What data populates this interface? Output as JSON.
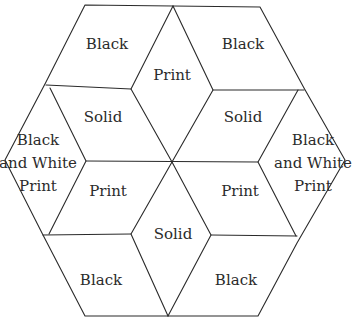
{
  "diagram": {
    "title": "",
    "type": "hexagon-quilt-block",
    "colors": {
      "line": "#2a2a2a",
      "text": "#2b2b2b",
      "background": "#ffffff"
    },
    "pieces": [
      {
        "id": "top-left",
        "label": "Black"
      },
      {
        "id": "top-center",
        "label": "Print"
      },
      {
        "id": "top-right",
        "label": "Black"
      },
      {
        "id": "upper-left-inner",
        "label": "Solid"
      },
      {
        "id": "upper-right-inner",
        "label": "Solid"
      },
      {
        "id": "left-side",
        "label_lines": [
          "Black",
          "and White",
          "Print"
        ]
      },
      {
        "id": "right-side",
        "label_lines": [
          "Black",
          "and White",
          "Print"
        ]
      },
      {
        "id": "lower-left-inner",
        "label": "Print"
      },
      {
        "id": "lower-right-inner",
        "label": "Print"
      },
      {
        "id": "bottom-center",
        "label": "Solid"
      },
      {
        "id": "bottom-left",
        "label": "Black"
      },
      {
        "id": "bottom-right",
        "label": "Black"
      }
    ]
  }
}
